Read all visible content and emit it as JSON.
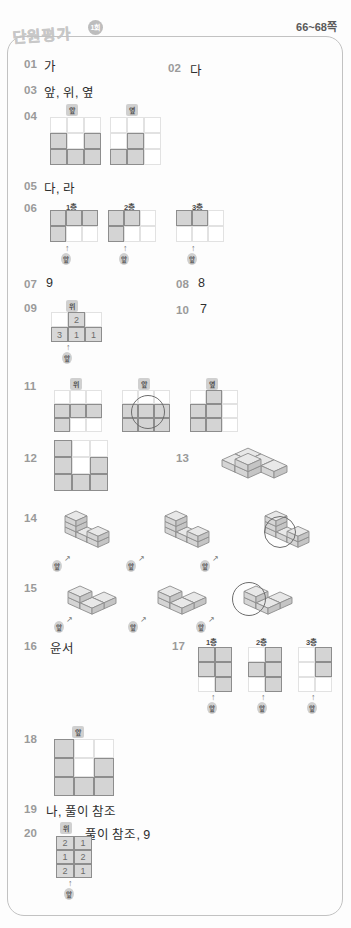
{
  "header": {
    "title": "단원평가",
    "round": "1회",
    "pages": "66~68쪽"
  },
  "view_labels": {
    "top": "위",
    "front": "앞",
    "side": "옆"
  },
  "layer_labels": {
    "l1": "1층",
    "l2": "2층",
    "l3": "3층"
  },
  "answers": [
    {
      "num": "01",
      "text": "가"
    },
    {
      "num": "02",
      "text": "다"
    },
    {
      "num": "03",
      "text": "앞, 위, 옆"
    },
    {
      "num": "04",
      "text": ""
    },
    {
      "num": "05",
      "text": "다, 라"
    },
    {
      "num": "06",
      "text": ""
    },
    {
      "num": "07",
      "text": "9"
    },
    {
      "num": "08",
      "text": "8"
    },
    {
      "num": "09",
      "text": ""
    },
    {
      "num": "10",
      "text": "7"
    },
    {
      "num": "11",
      "text": ""
    },
    {
      "num": "12",
      "text": ""
    },
    {
      "num": "13",
      "text": ""
    },
    {
      "num": "14",
      "text": ""
    },
    {
      "num": "15",
      "text": ""
    },
    {
      "num": "16",
      "text": "윤서"
    },
    {
      "num": "17",
      "text": ""
    },
    {
      "num": "18",
      "text": ""
    },
    {
      "num": "19",
      "text": "나, 풀이 참조"
    },
    {
      "num": "20",
      "text": ", 풀이 참조, 9"
    }
  ],
  "q04": {
    "front_grid": [
      [
        0,
        0,
        0
      ],
      [
        1,
        0,
        1
      ],
      [
        1,
        1,
        1
      ]
    ],
    "side_grid": [
      [
        0,
        0,
        0
      ],
      [
        0,
        1,
        0
      ],
      [
        1,
        1,
        0
      ]
    ]
  },
  "q06": {
    "l1": [
      [
        1,
        1,
        1
      ],
      [
        1,
        0,
        0
      ]
    ],
    "l2": [
      [
        1,
        1,
        0
      ],
      [
        1,
        0,
        0
      ]
    ],
    "l3": [
      [
        1,
        1,
        0
      ],
      [
        0,
        0,
        0
      ]
    ]
  },
  "q09": {
    "top_numbers": [
      [
        "",
        "2",
        ""
      ],
      [
        "3",
        "1",
        "1"
      ]
    ]
  },
  "q11": {
    "top": [
      [
        0,
        0,
        0
      ],
      [
        1,
        1,
        1
      ],
      [
        1,
        0,
        0
      ]
    ],
    "front": [
      [
        0,
        0,
        0
      ],
      [
        1,
        1,
        1
      ],
      [
        1,
        1,
        1
      ]
    ],
    "side": [
      [
        0,
        1,
        0
      ],
      [
        1,
        1,
        0
      ],
      [
        1,
        1,
        0
      ]
    ]
  },
  "q12": {
    "grid": [
      [
        1,
        0,
        0
      ],
      [
        1,
        0,
        1
      ],
      [
        1,
        1,
        1
      ]
    ]
  },
  "q17": {
    "l1": [
      [
        1,
        1
      ],
      [
        1,
        1
      ],
      [
        0,
        1
      ]
    ],
    "l2": [
      [
        0,
        1
      ],
      [
        1,
        1
      ],
      [
        0,
        1
      ]
    ],
    "l3": [
      [
        0,
        1
      ],
      [
        0,
        1
      ],
      [
        0,
        0
      ]
    ]
  },
  "q18": {
    "grid": [
      [
        1,
        0,
        0
      ],
      [
        1,
        0,
        1
      ],
      [
        1,
        1,
        1
      ]
    ]
  },
  "q20": {
    "top_numbers": [
      [
        "2",
        "1"
      ],
      [
        "1",
        "2"
      ],
      [
        "2",
        "1"
      ]
    ]
  },
  "colors": {
    "fill": "#d4d4d4",
    "stroke": "#8d8d8d",
    "light": "#e2e2e2",
    "num": "#9a9a9a",
    "text": "#2e2e2e"
  }
}
